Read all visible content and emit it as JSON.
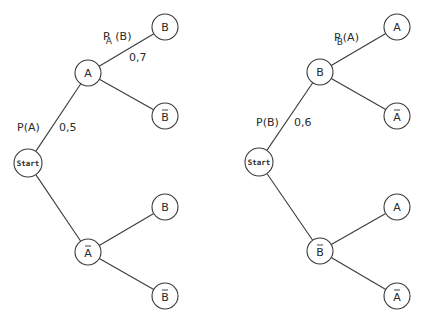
{
  "diagram": {
    "title": "",
    "trees": [
      {
        "id": "tree-a",
        "root": {
          "id": "start",
          "label": "Start",
          "cx": 28,
          "cy": 163,
          "r": 14,
          "start": true,
          "bar": false
        },
        "nodes": [
          {
            "id": "A",
            "label": "A",
            "cx": 88,
            "cy": 73,
            "r": 13,
            "bar": false
          },
          {
            "id": "A-B",
            "label": "B",
            "cx": 165,
            "cy": 27,
            "r": 13,
            "bar": false
          },
          {
            "id": "A-Bbar",
            "label": "B",
            "cx": 165,
            "cy": 116,
            "r": 13,
            "bar": true
          },
          {
            "id": "Abar",
            "label": "A",
            "cx": 88,
            "cy": 252,
            "r": 13,
            "bar": true
          },
          {
            "id": "Abar-B",
            "label": "B",
            "cx": 165,
            "cy": 207,
            "r": 13,
            "bar": false
          },
          {
            "id": "Abar-Bbar",
            "label": "B",
            "cx": 165,
            "cy": 296,
            "r": 13,
            "bar": true
          }
        ],
        "edges": [
          {
            "from": "start",
            "to": "A"
          },
          {
            "from": "start",
            "to": "Abar"
          },
          {
            "from": "A",
            "to": "A-B"
          },
          {
            "from": "A",
            "to": "A-Bbar"
          },
          {
            "from": "Abar",
            "to": "Abar-B"
          },
          {
            "from": "Abar",
            "to": "Abar-Bbar"
          }
        ],
        "labels": [
          {
            "id": "p-a",
            "main": "P(A)",
            "sub": "",
            "x": 17,
            "y": 131
          },
          {
            "id": "p-a-value",
            "main": "0,5",
            "sub": "",
            "x": 59,
            "y": 131
          },
          {
            "id": "pa-b",
            "main": "P",
            "sub": "A",
            "tail": " (B)",
            "x": 103,
            "y": 40
          },
          {
            "id": "pa-b-value",
            "main": "0,7",
            "sub": "",
            "x": 129,
            "y": 61
          }
        ]
      },
      {
        "id": "tree-b",
        "root": {
          "id": "start",
          "label": "Start",
          "cx": 259,
          "cy": 162,
          "r": 14,
          "start": true,
          "bar": false
        },
        "nodes": [
          {
            "id": "B",
            "label": "B",
            "cx": 320,
            "cy": 72,
            "r": 13,
            "bar": false
          },
          {
            "id": "B-A",
            "label": "A",
            "cx": 397,
            "cy": 27,
            "r": 13,
            "bar": false
          },
          {
            "id": "B-Abar",
            "label": "A",
            "cx": 397,
            "cy": 116,
            "r": 13,
            "bar": true
          },
          {
            "id": "Bbar",
            "label": "B",
            "cx": 320,
            "cy": 251,
            "r": 13,
            "bar": true
          },
          {
            "id": "Bbar-A",
            "label": "A",
            "cx": 397,
            "cy": 207,
            "r": 13,
            "bar": false
          },
          {
            "id": "Bbar-Abar",
            "label": "A",
            "cx": 397,
            "cy": 296,
            "r": 13,
            "bar": true
          }
        ],
        "edges": [
          {
            "from": "start",
            "to": "B"
          },
          {
            "from": "start",
            "to": "Bbar"
          },
          {
            "from": "B",
            "to": "B-A"
          },
          {
            "from": "B",
            "to": "B-Abar"
          },
          {
            "from": "Bbar",
            "to": "Bbar-A"
          },
          {
            "from": "Bbar",
            "to": "Bbar-Abar"
          }
        ],
        "labels": [
          {
            "id": "p-b",
            "main": "P(B)",
            "sub": "",
            "x": 256,
            "y": 126
          },
          {
            "id": "p-b-value",
            "main": "0,6",
            "sub": "",
            "x": 294,
            "y": 126
          },
          {
            "id": "pb-a",
            "main": "P",
            "sub": "B",
            "tail": "(A)",
            "x": 334,
            "y": 41
          }
        ]
      }
    ]
  },
  "colors": {
    "stroke": "#3a3a3a",
    "text": "#2a2a2a",
    "background": "#ffffff"
  }
}
